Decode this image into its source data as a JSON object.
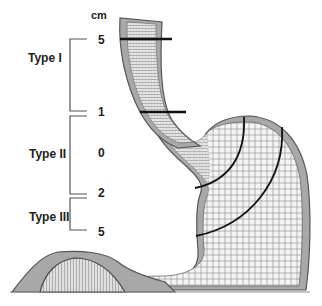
{
  "diagram": {
    "unit_label": "cm",
    "scale_ticks": [
      "5",
      "1",
      "0",
      "2",
      "5"
    ],
    "types": [
      {
        "label": "Type I",
        "range": "5 to 1 cm above"
      },
      {
        "label": "Type II",
        "range": "1 cm above to 2 cm below"
      },
      {
        "label": "Type III",
        "range": "2 to 5 cm below"
      }
    ],
    "colors": {
      "wall": "#9a9a9a",
      "wall_dark": "#4a4a4a",
      "mesh": "#8a8a8a",
      "marker_line": "#111111",
      "text": "#222222"
    }
  }
}
